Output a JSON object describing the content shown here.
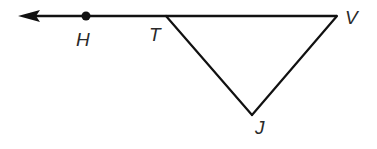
{
  "diagram": {
    "type": "geometry",
    "stroke_color": "#111111",
    "label_color": "#2a2a2a",
    "ray": {
      "from": "T",
      "direction": "left",
      "through": "H",
      "arrowhead": "left"
    },
    "points": {
      "H": {
        "label": "H",
        "x": 86,
        "y": 16,
        "marked_dot": true
      },
      "T": {
        "label": "T",
        "x": 166,
        "y": 16
      },
      "V": {
        "label": "V",
        "x": 337,
        "y": 16
      },
      "J": {
        "label": "J",
        "x": 252,
        "y": 115
      }
    },
    "segments": [
      {
        "from": "T",
        "to": "V"
      },
      {
        "from": "T",
        "to": "J"
      },
      {
        "from": "J",
        "to": "V"
      }
    ],
    "triangle": [
      "T",
      "V",
      "J"
    ]
  }
}
